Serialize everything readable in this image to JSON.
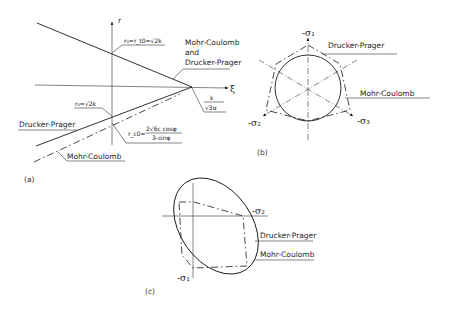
{
  "figure": {
    "panels": [
      {
        "id": "a",
        "caption": "(a)",
        "axes": {
          "vertical": "r",
          "horizontal": "ξ"
        },
        "annotations": {
          "top_intercept": "r₀=r_t0=√2k",
          "bottom_intercept": "r₀=√2k",
          "apex": {
            "numerator": "k",
            "denominator": "√3α"
          },
          "mc_intercept": {
            "lhs": "r_c0=",
            "numerator": "2√6c cosφ",
            "denominator": "3-sinφ"
          }
        },
        "labels": {
          "both_line_1": "Mohr-Coulomb",
          "both_line_2": "and",
          "both_line_3": "Drucker-Prager",
          "drucker_prager": "Drucker-Prager",
          "mohr_coulomb": "Mohr-Coulomb"
        }
      },
      {
        "id": "b",
        "caption": "(b)",
        "axes": {
          "s1": "-σ₁",
          "s2": "-σ₂",
          "s3": "-σ₃"
        },
        "labels": {
          "drucker_prager": "Drucker-Prager",
          "mohr_coulomb": "Mohr-Coulomb"
        }
      },
      {
        "id": "c",
        "caption": "(c)",
        "axes": {
          "s1": "-σ₁",
          "s2": "-σ₂"
        },
        "labels": {
          "drucker_prager": "Drucker-Prager",
          "mohr_coulomb": "Mohr-Coulomb"
        }
      }
    ]
  }
}
